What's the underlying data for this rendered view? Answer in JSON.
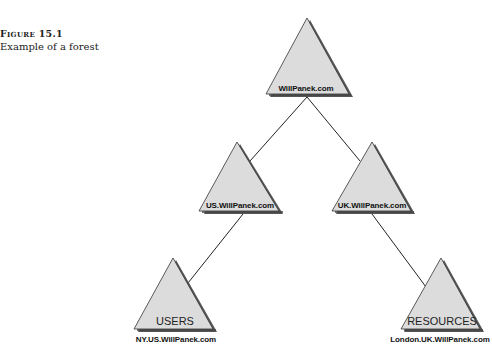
{
  "caption": {
    "label": "Figure 15.1",
    "text": "Example of a forest"
  },
  "colors": {
    "triangle_fill": "#dcdcdc",
    "triangle_shadow": "#555555",
    "outline": "#333333",
    "line": "#222222"
  },
  "nodes": [
    {
      "id": "root",
      "label": "WillPanek.com",
      "inner": ""
    },
    {
      "id": "us",
      "label": "US.WillPanek.com",
      "inner": ""
    },
    {
      "id": "uk",
      "label": "UK.WillPanek.com",
      "inner": ""
    },
    {
      "id": "ny",
      "label": "NY.US.WillPanek.com",
      "inner": "USERS"
    },
    {
      "id": "london",
      "label": "London.UK.WillPanek.com",
      "inner": "RESOURCES"
    }
  ],
  "edges": [
    {
      "from": "root",
      "to": "us"
    },
    {
      "from": "root",
      "to": "uk"
    },
    {
      "from": "us",
      "to": "ny"
    },
    {
      "from": "uk",
      "to": "london"
    }
  ]
}
